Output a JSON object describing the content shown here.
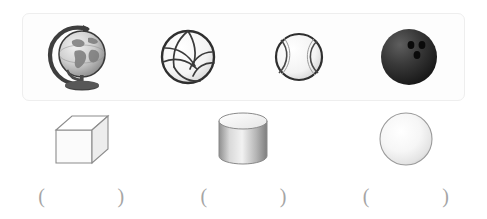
{
  "worksheet": {
    "objects_panel": {
      "items": [
        {
          "icon": "globe-icon",
          "label": "globe"
        },
        {
          "icon": "volleyball-icon",
          "label": "volleyball"
        },
        {
          "icon": "tennis-ball-icon",
          "label": "tennis ball"
        },
        {
          "icon": "bowling-ball-icon",
          "label": "bowling ball"
        }
      ]
    },
    "solids": [
      {
        "icon": "cube-icon",
        "label": "cube",
        "answer": ""
      },
      {
        "icon": "cylinder-icon",
        "label": "cylinder",
        "answer": ""
      },
      {
        "icon": "sphere-icon",
        "label": "sphere",
        "answer": ""
      }
    ],
    "answer_blanks": [
      {
        "open": "(",
        "close": ")",
        "value": ""
      },
      {
        "open": "(",
        "close": ")",
        "value": ""
      },
      {
        "open": "(",
        "close": ")",
        "value": ""
      }
    ],
    "colors": {
      "panel_background": "#fdfdfd",
      "panel_border": "#eeeeee",
      "page_background": "#ffffff",
      "paren_color": "#a5a5a5",
      "bowling_ball": "#2b2b2b",
      "outline": "#5a5a5a"
    }
  }
}
